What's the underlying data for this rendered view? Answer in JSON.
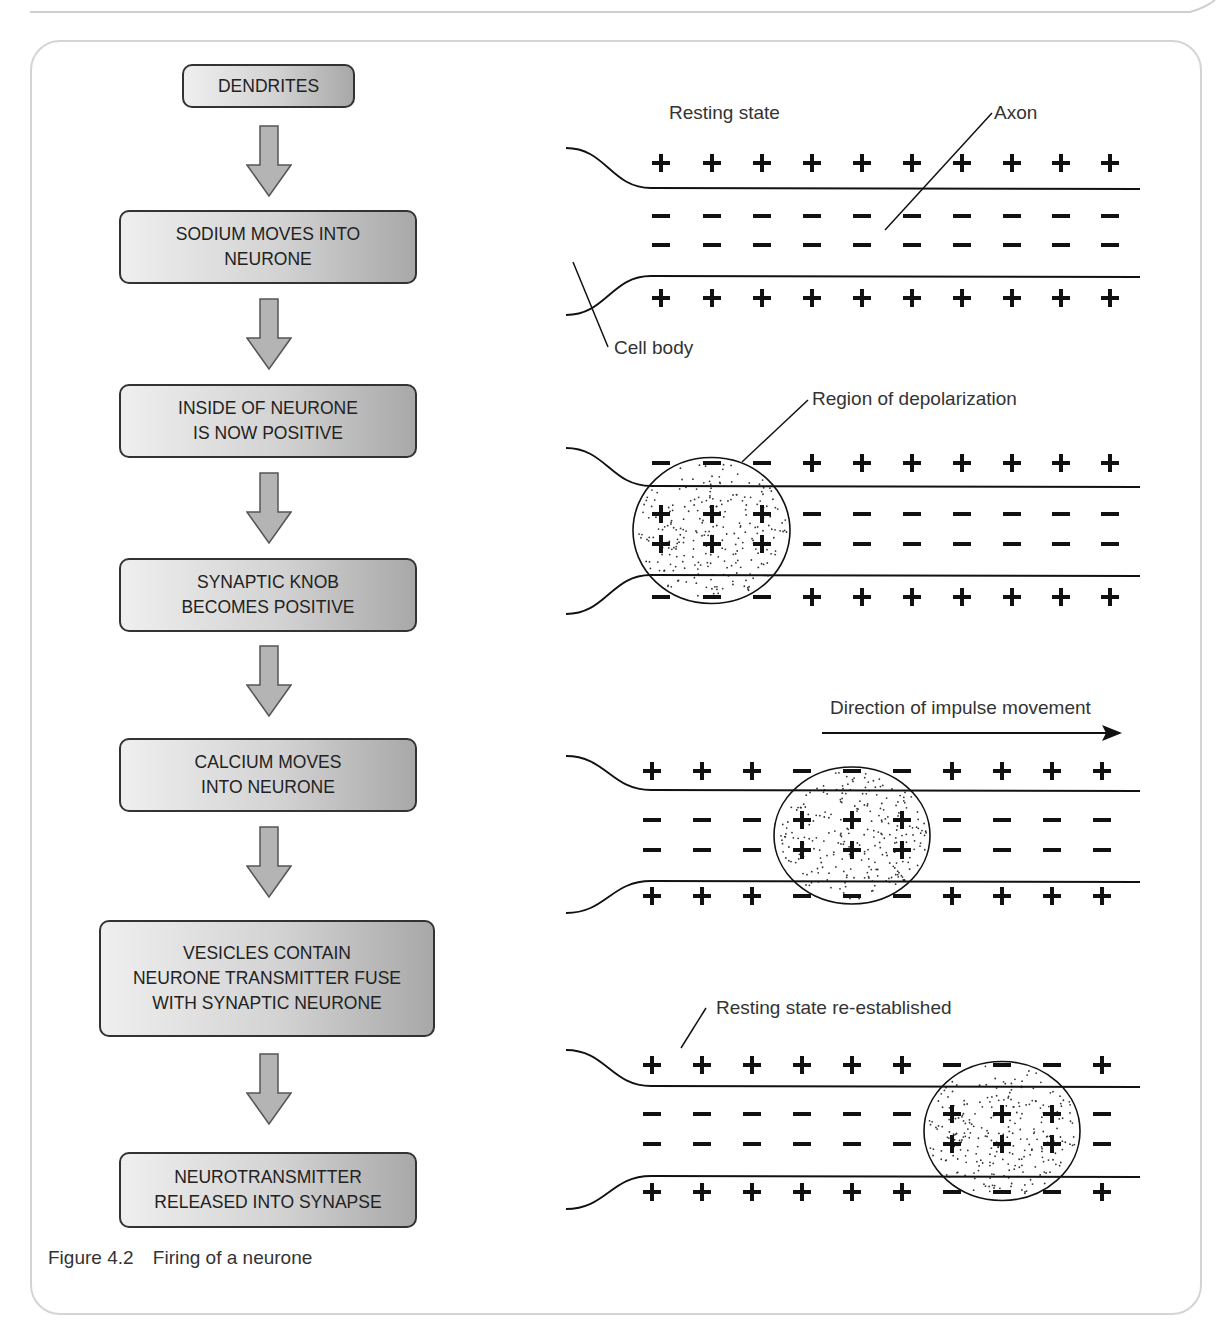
{
  "figure": {
    "number": "Figure 4.2",
    "title": "Firing of a neurone"
  },
  "flowchart": {
    "steps": [
      {
        "label": "DENDRITES"
      },
      {
        "label": "SODIUM MOVES INTO\nNEURONE"
      },
      {
        "label": "INSIDE OF NEURONE\nIS NOW POSITIVE"
      },
      {
        "label": "SYNAPTIC KNOB\nBECOMES POSITIVE"
      },
      {
        "label": "CALCIUM MOVES\nINTO NEURONE"
      },
      {
        "label": "VESICLES CONTAIN\nNEURONE TRANSMITTER FUSE\nWITH SYNAPTIC NEURONE"
      },
      {
        "label": "NEUROTRANSMITTER\nRELEASED INTO SYNAPSE"
      }
    ],
    "arrow_icon": "down-arrow-icon"
  },
  "axon_diagrams": {
    "panels": [
      {
        "name": "resting-state",
        "labels": {
          "state": "Resting state",
          "axon": "Axon",
          "cell_body": "Cell body"
        },
        "depolarized_columns": [],
        "charge_pattern": {
          "outer": [
            "+",
            "+",
            "+",
            "+",
            "+",
            "+",
            "+",
            "+",
            "+",
            "+"
          ],
          "inner": [
            "-",
            "-",
            "-",
            "-",
            "-",
            "-",
            "-",
            "-",
            "-",
            "-"
          ]
        }
      },
      {
        "name": "depolarization",
        "labels": {
          "region": "Region of depolarization"
        },
        "depolarized_columns": [
          0,
          1,
          2
        ],
        "charge_pattern": {
          "outer": [
            "-",
            "-",
            "-",
            "+",
            "+",
            "+",
            "+",
            "+",
            "+",
            "+"
          ],
          "inner": [
            "+",
            "+",
            "+",
            "-",
            "-",
            "-",
            "-",
            "-",
            "-",
            "-"
          ]
        }
      },
      {
        "name": "impulse-movement",
        "labels": {
          "direction": "Direction of impulse movement"
        },
        "depolarized_columns": [
          3,
          4,
          5
        ],
        "charge_pattern": {
          "outer": [
            "+",
            "+",
            "+",
            "-",
            "-",
            "-",
            "+",
            "+",
            "+",
            "+"
          ],
          "inner": [
            "-",
            "-",
            "-",
            "+",
            "+",
            "+",
            "-",
            "-",
            "-",
            "-"
          ]
        }
      },
      {
        "name": "resting-reestablished",
        "labels": {
          "state": "Resting state re-established"
        },
        "depolarized_columns": [
          6,
          7,
          8
        ],
        "charge_pattern": {
          "outer": [
            "+",
            "+",
            "+",
            "+",
            "+",
            "+",
            "-",
            "-",
            "-",
            "+"
          ],
          "inner": [
            "-",
            "-",
            "-",
            "-",
            "-",
            "-",
            "+",
            "+",
            "+",
            "-"
          ]
        }
      }
    ]
  },
  "colors": {
    "box_light": "#efefef",
    "box_dark": "#a8a8a8",
    "box_border": "#333333",
    "arrow_fill": "#b4b4b4",
    "ink": "#111111",
    "frame_border": "#d4d4d4"
  }
}
